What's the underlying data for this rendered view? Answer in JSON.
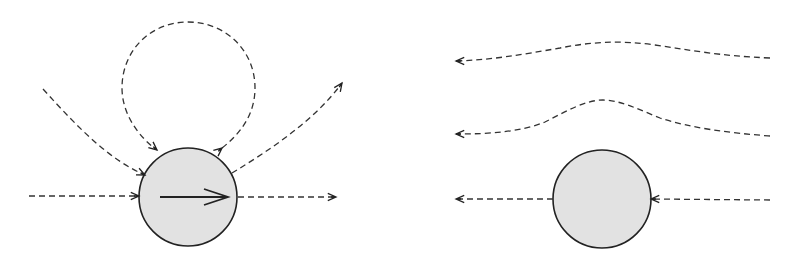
{
  "figure": {
    "panels": [
      {
        "id": "left",
        "description": "Moving body with velocity arrow; dashed trajectories of particles scattering off it",
        "body": {
          "cx": 188,
          "cy": 197,
          "r": 49,
          "fill": "#e2e2e2",
          "stroke": "#222222"
        },
        "velocity_arrow": {
          "x1": 160,
          "y1": 197,
          "x2": 228,
          "y2": 197,
          "direction": "right"
        },
        "trajectories": [
          {
            "name": "horizontal-incoming",
            "path": "M29,196 L139,196",
            "arrow_at": [
              139,
              196
            ],
            "arrow_angle": 0
          },
          {
            "name": "horizontal-outgoing",
            "path": "M238,197 L336,197",
            "arrow_at": [
              336,
              197
            ],
            "arrow_angle": 0
          },
          {
            "name": "diagonal-incoming",
            "path": "M43,89 C80,130 110,160 145,175",
            "arrow_at": [
              145,
              175
            ],
            "arrow_angle": 25
          },
          {
            "name": "loop",
            "path": "M222,148 C245,130 255,110 255,88 C255,50 225,22 188,22 C151,22 122,50 122,88 C122,115 140,138 157,150",
            "arrow_at": [
              157,
              150
            ],
            "arrow_angle": 40,
            "arrow2_at": [
              222,
              148
            ],
            "arrow2_angle": -40
          },
          {
            "name": "outgoing-curve",
            "path": "M232,173 C270,150 315,120 342,83",
            "arrow_at": [
              342,
              83
            ],
            "arrow_angle": -55
          }
        ]
      },
      {
        "id": "right",
        "description": "Stationary body; dashed streamlines flowing right-to-left",
        "body": {
          "cx": 602,
          "cy": 199,
          "r": 49,
          "fill": "#e2e2e2",
          "stroke": "#222222"
        },
        "trajectories": [
          {
            "name": "top-streamline",
            "path": "M770,58 C720,56 690,50 655,45 C620,40 590,42 560,48 C520,55 490,60 456,61",
            "arrow_at": [
              456,
              61
            ],
            "arrow_angle": 180
          },
          {
            "name": "middle-streamline",
            "path": "M770,136 C730,133 690,128 660,118 C640,110 620,100 603,100 C585,100 565,112 545,122 C520,132 490,134 456,134",
            "arrow_at": [
              456,
              134
            ],
            "arrow_angle": 180
          },
          {
            "name": "incoming-horizontal",
            "path": "M770,200 L651,199",
            "arrow_at": [
              651,
              199
            ],
            "arrow_angle": 180
          },
          {
            "name": "outgoing-horizontal",
            "path": "M553,199 L456,199",
            "arrow_at": [
              456,
              199
            ],
            "arrow_angle": 180
          }
        ]
      }
    ],
    "colors": {
      "line": "#333333",
      "body_fill": "#e2e2e2",
      "body_stroke": "#222222",
      "background": "#ffffff"
    },
    "labels": {
      "left_panel": "Scattering trajectories around moving body",
      "right_panel": "Streamlines around stationary body"
    }
  }
}
